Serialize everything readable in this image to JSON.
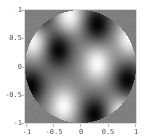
{
  "chart_data": {
    "type": "heatmap",
    "title": "",
    "xlabel": "",
    "ylabel": "",
    "xlim": [
      -1,
      1
    ],
    "ylim": [
      -1,
      1
    ],
    "grid": false,
    "legend": null,
    "colormap": "grayscale",
    "region": "unit disk x^2 + y^2 <= 1",
    "outside_color": "#7f7f7f",
    "xticks": [
      "-1",
      "-0.5",
      "0",
      "0.5",
      "1"
    ],
    "yticks": [
      "1",
      "0.5",
      "0",
      "-0.5",
      "-1"
    ],
    "peaks": [
      {
        "x": -0.2,
        "y": 0.9,
        "sign": 1
      },
      {
        "x": -0.85,
        "y": 0.45,
        "sign": 1
      },
      {
        "x": 0.3,
        "y": 0.05,
        "sign": 1
      },
      {
        "x": -0.3,
        "y": -0.7,
        "sign": 1
      },
      {
        "x": 0.9,
        "y": 0.5,
        "sign": 1
      },
      {
        "x": 0.75,
        "y": -0.85,
        "sign": 1
      },
      {
        "x": 0.3,
        "y": 0.75,
        "sign": -1
      },
      {
        "x": -0.4,
        "y": 0.3,
        "sign": -1
      },
      {
        "x": -0.9,
        "y": -0.35,
        "sign": -1
      },
      {
        "x": 0.25,
        "y": -0.85,
        "sign": -1
      },
      {
        "x": 0.85,
        "y": -0.25,
        "sign": -1
      },
      {
        "x": -0.75,
        "y": 0.95,
        "sign": -1
      }
    ]
  }
}
